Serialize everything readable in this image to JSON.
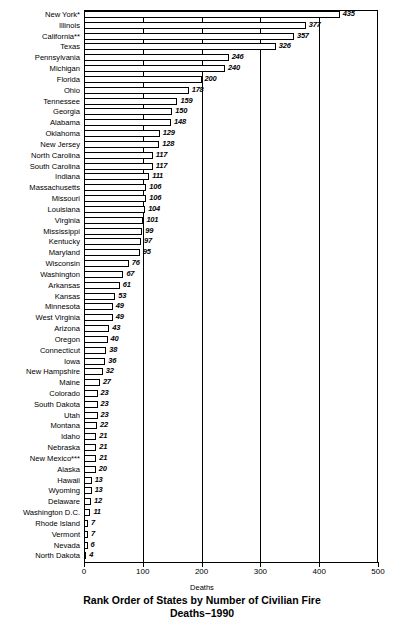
{
  "chart_data": {
    "type": "bar",
    "orientation": "horizontal",
    "title": "Rank Order of States by Number of Civilian Fire Deaths–1990",
    "title_line1": "Rank Order of States by Number of Civilian Fire",
    "title_line2": "Deaths–1990",
    "xlabel": "Deaths",
    "ylabel": "",
    "xlim": [
      0,
      500
    ],
    "xticks": [
      0,
      100,
      200,
      300,
      400,
      500
    ],
    "xtick_labels": [
      "0",
      "100",
      "200",
      "300",
      "400",
      "500"
    ],
    "grid": true,
    "legend": null,
    "categories": [
      "New York*",
      "Illinois",
      "California**",
      "Texas",
      "Pennsylvania",
      "Michigan",
      "Florida",
      "Ohio",
      "Tennessee",
      "Georgia",
      "Alabama",
      "Oklahoma",
      "New Jersey",
      "North Carolina",
      "South Carolina",
      "Indiana",
      "Massachusetts",
      "Missouri",
      "Louisiana",
      "Virginia",
      "Mississippi",
      "Kentucky",
      "Maryland",
      "Wisconsin",
      "Washington",
      "Arkansas",
      "Kansas",
      "Minnesota",
      "West Virginia",
      "Arizona",
      "Oregon",
      "Connecticut",
      "Iowa",
      "New Hampshire",
      "Maine",
      "Colorado",
      "South Dakota",
      "Utah",
      "Montana",
      "Idaho",
      "Nebraska",
      "New Mexico***",
      "Alaska",
      "Hawaii",
      "Wyoming",
      "Delaware",
      "Washington D.C.",
      "Rhode Island",
      "Vermont",
      "Nevada",
      "North Dakota"
    ],
    "values": [
      435,
      377,
      357,
      326,
      246,
      240,
      200,
      178,
      159,
      150,
      148,
      129,
      128,
      117,
      117,
      111,
      106,
      106,
      104,
      101,
      99,
      97,
      95,
      76,
      67,
      61,
      53,
      49,
      49,
      43,
      40,
      38,
      36,
      32,
      27,
      23,
      23,
      23,
      22,
      21,
      21,
      21,
      20,
      13,
      13,
      12,
      11,
      7,
      7,
      6,
      4
    ]
  },
  "colors": {
    "bar_fill": "#ffffff",
    "bar_stroke": "#000000",
    "axis": "#000000",
    "text": "#000000",
    "background": "#ffffff"
  }
}
